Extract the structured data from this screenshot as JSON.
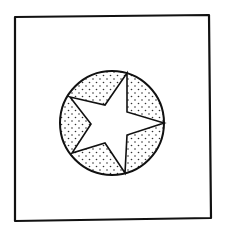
{
  "figure": {
    "frame": {
      "points": [
        [
          15,
          17
        ],
        [
          209,
          15
        ],
        [
          211,
          218
        ],
        [
          15,
          221
        ]
      ],
      "stroke": "#111111"
    },
    "circle": {
      "cx": 112,
      "cy": 123,
      "r": 52,
      "stroke": "#111111"
    },
    "star": {
      "outer_points": [
        [
          127,
          73
        ],
        [
          164,
          123
        ],
        [
          125,
          173
        ],
        [
          72,
          153
        ],
        [
          70,
          97
        ]
      ],
      "inner_points": [
        [
          127,
          112
        ],
        [
          127,
          135
        ],
        [
          105,
          143
        ],
        [
          91,
          124
        ],
        [
          105,
          105
        ]
      ],
      "fill": "#ffffff",
      "stroke": "#111111"
    },
    "stipple": {
      "dot_color": "#333333",
      "regions": 5
    }
  }
}
